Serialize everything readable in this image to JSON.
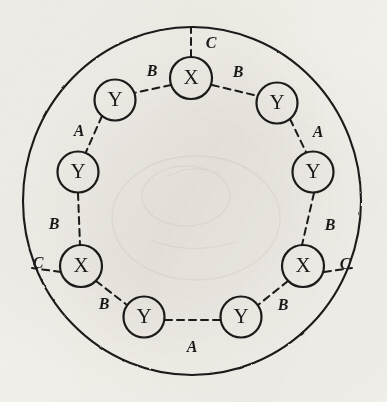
{
  "figure": {
    "ink_color": "#1a1a1a",
    "paper_color": "#f4f2ee",
    "outer_circle": {
      "name": "outer-boundary-circle",
      "cx": 192,
      "cy": 201,
      "rx": 169,
      "ry": 174,
      "stroke_width": 2.1,
      "style": "solid"
    },
    "node_radius": 20.5,
    "node_stroke_width": 2.2,
    "node_label_size": 21,
    "edge_label_size": 16,
    "edge_style": "dashed",
    "edge_stroke_width": 2.0,
    "edge_dash": "7,5",
    "nodes": [
      {
        "id": "x-top",
        "label": "X",
        "cx": 191,
        "cy": 78,
        "r": 21,
        "position": "top"
      },
      {
        "id": "y-upper-right",
        "label": "Y",
        "cx": 277,
        "cy": 103,
        "r": 20.5,
        "position": "upper-right"
      },
      {
        "id": "y-right",
        "label": "Y",
        "cx": 313,
        "cy": 172,
        "r": 20.5,
        "position": "right"
      },
      {
        "id": "x-lower-right",
        "label": "X",
        "cx": 303,
        "cy": 266,
        "r": 21,
        "position": "lower-right"
      },
      {
        "id": "y-bottom-right",
        "label": "Y",
        "cx": 241,
        "cy": 317,
        "r": 20.5,
        "position": "bottom-right"
      },
      {
        "id": "y-bottom-left",
        "label": "Y",
        "cx": 144,
        "cy": 317,
        "r": 20.5,
        "position": "bottom-left"
      },
      {
        "id": "x-lower-left",
        "label": "X",
        "cx": 81,
        "cy": 266,
        "r": 21,
        "position": "lower-left"
      },
      {
        "id": "y-left",
        "label": "Y",
        "cx": 78,
        "cy": 172,
        "r": 20.5,
        "position": "left"
      },
      {
        "id": "y-upper-left",
        "label": "Y",
        "cx": 115,
        "cy": 100,
        "r": 20.5,
        "position": "upper-left"
      }
    ],
    "edges": [
      {
        "id": "edge-x-top-to-boundary",
        "from": "x-top",
        "to": "outer-circle",
        "label": "C",
        "label_x": 211,
        "label_y": 44,
        "x1": 191,
        "y1": 57,
        "x2": 191,
        "y2": 28
      },
      {
        "id": "edge-x-top-y-upper-left",
        "from": "x-top",
        "to": "y-upper-left",
        "label": "B",
        "label_x": 152,
        "label_y": 72,
        "x1": 171,
        "y1": 85,
        "x2": 134,
        "y2": 93
      },
      {
        "id": "edge-x-top-y-upper-right",
        "from": "x-top",
        "to": "y-upper-right",
        "label": "B",
        "label_x": 238,
        "label_y": 73,
        "x1": 212,
        "y1": 85,
        "x2": 258,
        "y2": 96
      },
      {
        "id": "edge-y-upper-left-y-left",
        "from": "y-upper-left",
        "to": "y-left",
        "label": "A",
        "label_x": 79,
        "label_y": 132,
        "x1": 102,
        "y1": 116,
        "x2": 86,
        "y2": 152
      },
      {
        "id": "edge-y-upper-right-y-right",
        "from": "y-upper-right",
        "to": "y-right",
        "label": "A",
        "label_x": 318,
        "label_y": 133,
        "x1": 290,
        "y1": 119,
        "x2": 306,
        "y2": 152
      },
      {
        "id": "edge-y-left-x-lower-left",
        "from": "y-left",
        "to": "x-lower-left",
        "label": "B",
        "label_x": 54,
        "label_y": 225,
        "x1": 78,
        "y1": 193,
        "x2": 80,
        "y2": 245
      },
      {
        "id": "edge-y-right-x-lower-right",
        "from": "y-right",
        "to": "x-lower-right",
        "label": "B",
        "label_x": 330,
        "label_y": 226,
        "x1": 314,
        "y1": 193,
        "x2": 302,
        "y2": 245
      },
      {
        "id": "edge-x-lower-left-to-boundary",
        "from": "x-lower-left",
        "to": "outer-circle",
        "label": "C",
        "label_x": 38,
        "label_y": 264,
        "x1": 61,
        "y1": 272,
        "x2": 32,
        "y2": 268
      },
      {
        "id": "edge-x-lower-right-to-boundary",
        "from": "x-lower-right",
        "to": "outer-circle",
        "label": "C",
        "label_x": 345,
        "label_y": 265,
        "x1": 324,
        "y1": 272,
        "x2": 352,
        "y2": 268
      },
      {
        "id": "edge-x-lower-left-y-bottom-left",
        "from": "x-lower-left",
        "to": "y-bottom-left",
        "label": "B",
        "label_x": 104,
        "label_y": 305,
        "x1": 96,
        "y1": 281,
        "x2": 127,
        "y2": 305
      },
      {
        "id": "edge-x-lower-right-y-bottom-right",
        "from": "x-lower-right",
        "to": "y-bottom-right",
        "label": "B",
        "label_x": 283,
        "label_y": 306,
        "x1": 288,
        "y1": 281,
        "x2": 258,
        "y2": 305
      },
      {
        "id": "edge-y-bottom-left-y-bottom-right",
        "from": "y-bottom-left",
        "to": "y-bottom-right",
        "label": "A",
        "label_x": 192,
        "label_y": 348,
        "x1": 165,
        "y1": 320,
        "x2": 220,
        "y2": 320
      }
    ]
  }
}
